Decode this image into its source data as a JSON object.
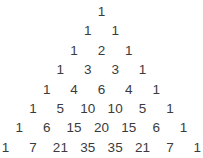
{
  "figure": {
    "name": "pascals-triangle",
    "background_color": "#ffffff",
    "text_color": "#3b3b3d",
    "row_count": 8
  },
  "chart_data": {
    "type": "table",
    "xlabel": "",
    "ylabel": "",
    "rows": [
      {
        "index": 0,
        "values": [
          1
        ]
      },
      {
        "index": 1,
        "values": [
          1,
          1
        ]
      },
      {
        "index": 2,
        "values": [
          1,
          2,
          1
        ]
      },
      {
        "index": 3,
        "values": [
          1,
          3,
          3,
          1
        ]
      },
      {
        "index": 4,
        "values": [
          1,
          4,
          6,
          4,
          1
        ]
      },
      {
        "index": 5,
        "values": [
          1,
          5,
          10,
          10,
          5,
          1
        ]
      },
      {
        "index": 6,
        "values": [
          1,
          6,
          15,
          20,
          15,
          6,
          1
        ]
      },
      {
        "index": 7,
        "values": [
          1,
          7,
          21,
          35,
          35,
          21,
          7,
          1
        ]
      }
    ]
  },
  "rows": [
    {
      "cells": [
        "1"
      ]
    },
    {
      "cells": [
        "1",
        "1"
      ]
    },
    {
      "cells": [
        "1",
        "2",
        "1"
      ]
    },
    {
      "cells": [
        "1",
        "3",
        "3",
        "1"
      ]
    },
    {
      "cells": [
        "1",
        "4",
        "6",
        "4",
        "1"
      ]
    },
    {
      "cells": [
        "1",
        "5",
        "10",
        "10",
        "5",
        "1"
      ]
    },
    {
      "cells": [
        "1",
        "6",
        "15",
        "20",
        "15",
        "6",
        "1"
      ]
    },
    {
      "cells": [
        "1",
        "7",
        "21",
        "35",
        "35",
        "21",
        "7",
        "1"
      ]
    }
  ]
}
